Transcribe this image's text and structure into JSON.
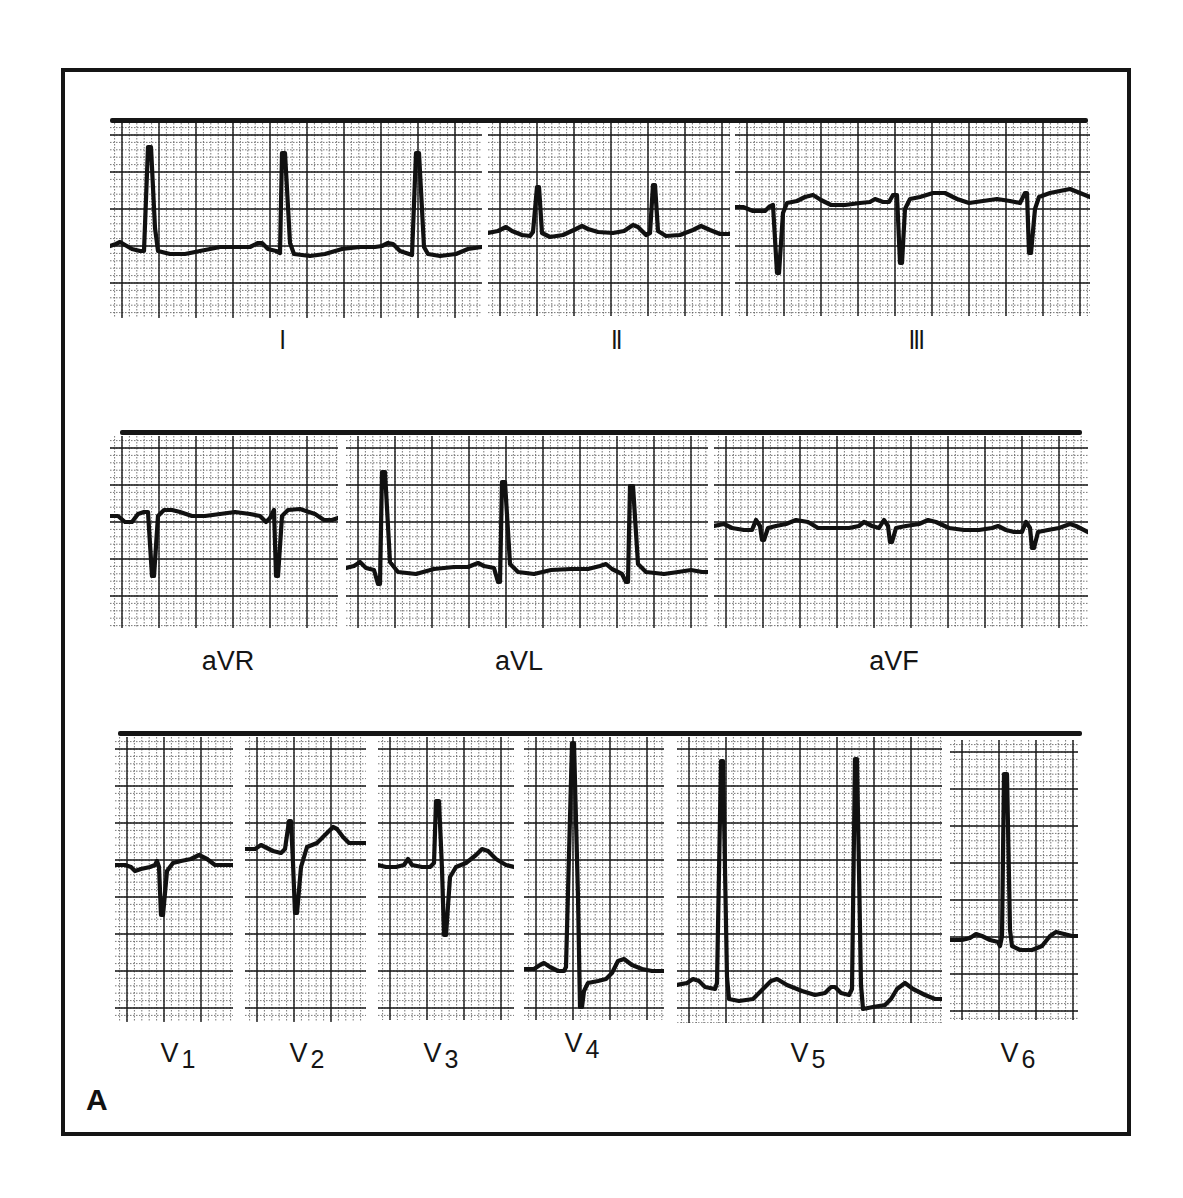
{
  "figure": {
    "panel_letter": "A",
    "rows": [
      {
        "bar": {
          "x": 110,
          "y": 118,
          "w": 978
        },
        "leads": [
          {
            "id": "I",
            "label": "I",
            "sub": "",
            "roman": true,
            "box": {
              "x": 110,
              "y": 123,
              "w": 372,
              "h": 195
            },
            "label_pos": {
              "x": 283,
              "y": 326
            },
            "trace": "M0,123 L6,121 L10,119 L15,122 L22,126 L30,128 L34,128 L38,24 L41,24 L45,105 L48,128 L60,131 L75,131 L90,128 L110,124 L130,124 L140,124 L148,120 L152,120 L158,126 L166,128 L170,130 L172,30 L175,30 L180,120 L184,131 L200,133 L215,131 L232,126 L250,124 L265,124 L272,123 L278,120 L283,121 L290,128 L302,132 L306,30 L309,30 L314,124 L318,131 L330,133 L346,131 L358,126 L372,124"
          },
          {
            "id": "II",
            "label": "II",
            "sub": "",
            "roman": true,
            "box": {
              "x": 488,
              "y": 123,
              "w": 242,
              "h": 193
            },
            "label_pos": {
              "x": 617,
              "y": 326
            },
            "trace": "M0,110 L10,108 L18,104 L24,108 L34,112 L42,113 L45,109 L49,64 L51,64 L54,110 L62,114 L75,112 L88,106 L94,103 L100,106 L110,109 L125,110 L136,108 L145,102 L150,104 L158,112 L162,110 L165,62 L167,62 L170,108 L178,113 L192,112 L205,107 L213,103 L222,107 L232,111 L242,111"
          },
          {
            "id": "III",
            "label": "III",
            "sub": "",
            "roman": true,
            "box": {
              "x": 735,
              "y": 123,
              "w": 355,
              "h": 193
            },
            "label_pos": {
              "x": 917,
              "y": 326
            },
            "trace": "M0,84 L8,84 L18,88 L30,88 L34,84 L38,82 L42,150 L44,150 L48,90 L52,80 L62,78 L70,74 L78,72 L86,77 L96,82 L110,82 L125,80 L135,79 L140,76 L148,79 L154,79 L158,72 L162,72 L165,140 L167,140 L170,86 L175,76 L185,74 L198,70 L210,70 L222,76 L234,80 L248,78 L262,76 L275,78 L285,80 L290,70 L292,70 L294,130 L296,130 L300,86 L304,74 L315,70 L325,68 L335,66 L345,70 L355,74"
          }
        ]
      },
      {
        "bar": {
          "x": 120,
          "y": 430,
          "w": 962
        },
        "leads": [
          {
            "id": "aVR",
            "label": "aVR",
            "sub": "",
            "roman": false,
            "box": {
              "x": 110,
              "y": 436,
              "w": 228,
              "h": 192
            },
            "label_pos": {
              "x": 228,
              "y": 648
            },
            "trace": "M0,80 L8,80 L15,86 L22,86 L28,78 L34,76 L38,76 L42,140 L44,140 L48,80 L54,74 L62,74 L70,76 L82,80 L95,80 L110,78 L125,76 L140,78 L150,80 L156,86 L160,82 L164,74 L166,140 L168,140 L172,80 L178,74 L190,73 L205,78 L214,84 L222,84 L228,82"
          },
          {
            "id": "aVL",
            "label": "aVL",
            "sub": "",
            "roman": false,
            "box": {
              "x": 346,
              "y": 436,
              "w": 362,
              "h": 192
            },
            "label_pos": {
              "x": 519,
              "y": 648
            },
            "trace": "M0,132 L8,130 L14,126 L20,132 L28,134 L32,148 L34,148 L36,36 L39,36 L44,126 L52,136 L70,138 L88,133 L108,131 L122,131 L132,127 L138,130 L148,132 L152,146 L154,146 L156,46 L159,46 L164,128 L172,136 L188,138 L205,134 L225,133 L242,133 L254,130 L260,128 L266,133 L276,138 L280,146 L282,146 L284,50 L287,50 L292,128 L300,136 L318,138 L332,136 L345,134 L356,136 L362,136"
          },
          {
            "id": "aVF",
            "label": "aVF",
            "sub": "",
            "roman": false,
            "box": {
              "x": 714,
              "y": 436,
              "w": 374,
              "h": 192
            },
            "label_pos": {
              "x": 894,
              "y": 648
            },
            "trace": "M0,90 L10,88 L18,92 L30,94 L38,94 L42,84 L46,90 L48,104 L50,104 L54,92 L62,90 L72,88 L82,84 L94,86 L104,92 L120,92 L135,92 L145,90 L150,86 L158,90 L165,92 L170,84 L174,90 L176,106 L178,106 L182,92 L192,90 L205,88 L214,84 L222,86 L235,92 L250,94 L265,94 L278,92 L284,90 L292,94 L300,96 L308,96 L312,86 L316,92 L318,112 L320,112 L324,96 L334,94 L345,92 L356,88 L362,90 L374,96"
          }
        ]
      },
      {
        "bar": {
          "x": 118,
          "y": 731,
          "w": 964
        },
        "leads": [
          {
            "id": "V1",
            "label": "V",
            "sub": "1",
            "roman": false,
            "box": {
              "x": 115,
              "y": 737,
              "w": 118,
              "h": 285
            },
            "label_pos": {
              "x": 178,
              "y": 1040
            },
            "trace": "M0,128 L10,128 L16,130 L20,134 L26,132 L35,130 L40,128 L42,124 L44,130 L46,178 L48,178 L52,134 L58,126 L66,124 L76,122 L84,118 L92,122 L100,128 L110,128 L118,128"
          },
          {
            "id": "V2",
            "label": "V",
            "sub": "2",
            "roman": false,
            "box": {
              "x": 245,
              "y": 737,
              "w": 121,
              "h": 285
            },
            "label_pos": {
              "x": 307,
              "y": 1040
            },
            "trace": "M0,112 L10,112 L16,108 L20,110 L28,114 L36,116 L40,112 L44,84 L46,84 L48,126 L50,176 L52,176 L56,130 L62,110 L72,106 L82,96 L88,90 L92,92 L98,100 L104,106 L114,106 L121,106"
          },
          {
            "id": "V3",
            "label": "V",
            "sub": "3",
            "roman": false,
            "box": {
              "x": 378,
              "y": 737,
              "w": 136,
              "h": 283
            },
            "label_pos": {
              "x": 441,
              "y": 1040
            },
            "trace": "M0,128 L8,130 L18,130 L26,128 L30,122 L34,128 L44,130 L52,130 L56,126 L58,64 L61,64 L64,132 L66,198 L68,198 L72,140 L78,130 L88,126 L98,118 L104,112 L110,114 L118,122 L128,128 L136,130"
          },
          {
            "id": "V4",
            "label": "V",
            "sub": "4",
            "roman": false,
            "box": {
              "x": 524,
              "y": 737,
              "w": 140,
              "h": 283
            },
            "label_pos": {
              "x": 582,
              "y": 1030
            },
            "trace": "M0,232 L10,232 L16,228 L20,226 L26,230 L34,234 L40,234 L42,230 L48,6 L50,6 L54,160 L56,270 L58,270 L60,254 L64,246 L74,244 L82,242 L88,236 L94,224 L100,222 L108,228 L118,232 L128,234 L140,234"
          },
          {
            "id": "V5",
            "label": "V",
            "sub": "5",
            "roman": false,
            "box": {
              "x": 677,
              "y": 737,
              "w": 265,
              "h": 286
            },
            "label_pos": {
              "x": 808,
              "y": 1040
            },
            "trace": "M0,248 L10,246 L16,242 L22,244 L28,250 L38,252 L40,246 L44,24 L46,24 L50,240 L52,262 L62,264 L76,262 L86,252 L94,244 L100,242 L110,248 L125,254 L138,258 L148,256 L154,250 L158,250 L164,256 L172,258 L175,252 L178,22 L180,22 L184,248 L186,272 L196,270 L208,268 L214,262 L220,252 L228,246 L236,252 L248,258 L258,262 L265,262"
          },
          {
            "id": "V6",
            "label": "V",
            "sub": "6",
            "roman": false,
            "box": {
              "x": 950,
              "y": 740,
              "w": 128,
              "h": 280
            },
            "label_pos": {
              "x": 1018,
              "y": 1040
            },
            "trace": "M0,200 L12,200 L20,198 L26,194 L32,196 L40,200 L48,202 L50,206 L52,196 L54,34 L57,34 L60,190 L62,206 L70,210 L82,210 L92,206 L100,196 L106,192 L114,194 L122,196 L128,196"
          }
        ]
      }
    ],
    "grid": {
      "major_px": 37,
      "minor_px": 7.4,
      "major_color": "#1a1a1a",
      "minor_color": "#555555",
      "trace_color": "#111111"
    }
  }
}
